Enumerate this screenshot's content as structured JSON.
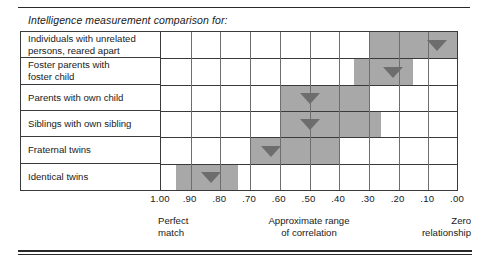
{
  "title": "Intelligence measurement comparison for:",
  "axis": {
    "ticks": [
      "1.00",
      ".90",
      ".80",
      ".70",
      ".60",
      ".50",
      ".40",
      ".30",
      ".20",
      ".10",
      ".00"
    ]
  },
  "captions": {
    "left_line1": "Perfect",
    "left_line2": "match",
    "mid_line1": "Approximate range",
    "mid_line2": "of correlation",
    "right_line1": "Zero",
    "right_line2": "relationship"
  },
  "rows": [
    {
      "label_line1": "Individuals with unrelated",
      "label_line2": "persons, reared apart"
    },
    {
      "label_line1": "Foster parents with",
      "label_line2": "foster child"
    },
    {
      "label_line1": "Parents with own child",
      "label_line2": ""
    },
    {
      "label_line1": "Siblings with own sibling",
      "label_line2": ""
    },
    {
      "label_line1": "Fraternal twins",
      "label_line2": ""
    },
    {
      "label_line1": "Identical twins",
      "label_line2": ""
    }
  ],
  "colors": {
    "bar_fill": "#a8a8a8",
    "marker_fill": "#6d6d6d",
    "grid_line": "#6e6e6e",
    "border": "#3a3a3a",
    "text": "#1a1a1a",
    "background": "#ffffff"
  },
  "chart_data": {
    "type": "bar",
    "title": "Intelligence measurement comparison for:",
    "xlabel": "Approximate range of correlation",
    "ylabel": "",
    "xlim": [
      1.0,
      0.0
    ],
    "x_axis_reversed": true,
    "x_ticks": [
      1.0,
      0.9,
      0.8,
      0.7,
      0.6,
      0.5,
      0.4,
      0.3,
      0.2,
      0.1,
      0.0
    ],
    "x_tick_labels": [
      "1.00",
      ".90",
      ".80",
      ".70",
      ".60",
      ".50",
      ".40",
      ".30",
      ".20",
      ".10",
      ".00"
    ],
    "grid": true,
    "legend": "none",
    "annotations": [
      {
        "text": "Perfect match",
        "x": 1.0
      },
      {
        "text": "Approximate range of correlation",
        "x": 0.5
      },
      {
        "text": "Zero relationship",
        "x": 0.0
      }
    ],
    "categories": [
      "Individuals with unrelated persons, reared apart",
      "Foster parents with foster child",
      "Parents with own child",
      "Siblings with own sibling",
      "Fraternal twins",
      "Identical twins"
    ],
    "series": [
      {
        "name": "Approximate range of correlation",
        "type": "range",
        "values": [
          {
            "category": "Individuals with unrelated persons, reared apart",
            "range_start": 0.3,
            "range_end": 0.0,
            "marker": 0.07
          },
          {
            "category": "Foster parents with foster child",
            "range_start": 0.35,
            "range_end": 0.15,
            "marker": 0.22
          },
          {
            "category": "Parents with own child",
            "range_start": 0.6,
            "range_end": 0.3,
            "marker": 0.5
          },
          {
            "category": "Siblings with own sibling",
            "range_start": 0.6,
            "range_end": 0.26,
            "marker": 0.5
          },
          {
            "category": "Fraternal twins",
            "range_start": 0.7,
            "range_end": 0.4,
            "marker": 0.63
          },
          {
            "category": "Identical twins",
            "range_start": 0.95,
            "range_end": 0.74,
            "marker": 0.83
          }
        ]
      }
    ]
  }
}
